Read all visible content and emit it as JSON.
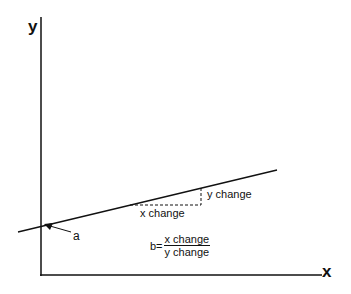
{
  "diagram": {
    "axes": {
      "y_label": "y",
      "x_label": "x"
    },
    "labels": {
      "intercept": "a",
      "x_change": "x change",
      "y_change": "y change"
    },
    "formula": {
      "lhs": "b=",
      "numerator": "x change",
      "denominator": "y change"
    }
  }
}
